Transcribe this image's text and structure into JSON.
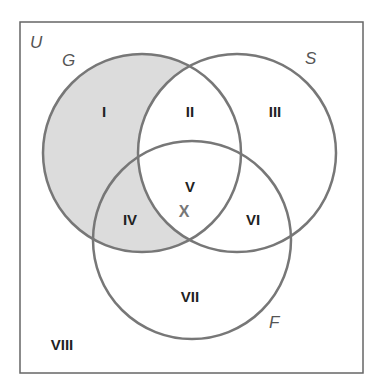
{
  "diagram": {
    "type": "venn",
    "universe": {
      "label": "U"
    },
    "sets": [
      {
        "id": "G",
        "label": "G"
      },
      {
        "id": "S",
        "label": "S"
      },
      {
        "id": "F",
        "label": "F"
      }
    ],
    "regions": [
      {
        "id": "I",
        "label": "I",
        "sets": [
          "G"
        ],
        "shaded": true
      },
      {
        "id": "II",
        "label": "II",
        "sets": [
          "G",
          "S"
        ],
        "shaded": false
      },
      {
        "id": "III",
        "label": "III",
        "sets": [
          "S"
        ],
        "shaded": false
      },
      {
        "id": "IV",
        "label": "IV",
        "sets": [
          "G",
          "F"
        ],
        "shaded": true
      },
      {
        "id": "V",
        "label": "V",
        "sets": [
          "G",
          "S",
          "F"
        ],
        "shaded": false
      },
      {
        "id": "VI",
        "label": "VI",
        "sets": [
          "S",
          "F"
        ],
        "shaded": false
      },
      {
        "id": "VII",
        "label": "VII",
        "sets": [
          "F"
        ],
        "shaded": false
      },
      {
        "id": "VIII",
        "label": "VIII",
        "sets": [],
        "shaded": false
      }
    ],
    "element_marker": {
      "label": "X",
      "region": "V"
    },
    "colors": {
      "shade": "#dcdcdc",
      "stroke": "#777777",
      "border": "#666666"
    }
  }
}
